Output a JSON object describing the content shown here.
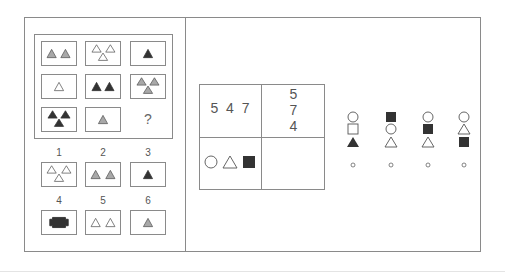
{
  "puzzle_left": {
    "matrix": [
      {
        "cell": "r1c1",
        "desc": "two gray triangles"
      },
      {
        "cell": "r1c2",
        "desc": "three white triangles"
      },
      {
        "cell": "r1c3",
        "desc": "one black triangle"
      },
      {
        "cell": "r2c1",
        "desc": "one white triangle"
      },
      {
        "cell": "r2c2",
        "desc": "two black triangles"
      },
      {
        "cell": "r2c3",
        "desc": "three gray triangles"
      },
      {
        "cell": "r3c1",
        "desc": "three black triangles"
      },
      {
        "cell": "r3c2",
        "desc": "one gray triangle"
      },
      {
        "cell": "r3c3",
        "desc": "?"
      }
    ],
    "question_mark": "?",
    "options": [
      {
        "label": "1",
        "desc": "three white triangles"
      },
      {
        "label": "2",
        "desc": "two gray triangles"
      },
      {
        "label": "3",
        "desc": "one black triangle"
      },
      {
        "label": "4",
        "desc": "black blob shape"
      },
      {
        "label": "5",
        "desc": "two white triangles"
      },
      {
        "label": "6",
        "desc": "one gray triangle"
      }
    ]
  },
  "puzzle_right": {
    "grid": {
      "top_left": "5 4 7",
      "top_right": [
        "5",
        "7",
        "4"
      ],
      "bottom_left": "circle, triangle, black square",
      "bottom_right": ""
    },
    "options": [
      {
        "index": 1,
        "stack": [
          "circle",
          "square",
          "black triangle"
        ]
      },
      {
        "index": 2,
        "stack": [
          "black square",
          "circle",
          "triangle"
        ]
      },
      {
        "index": 3,
        "stack": [
          "circle",
          "black square",
          "triangle"
        ]
      },
      {
        "index": 4,
        "stack": [
          "circle",
          "triangle",
          "black square"
        ]
      }
    ],
    "option_marker": "o"
  },
  "colors": {
    "line": "#8a8a8a",
    "black_fill": "#333333",
    "gray_fill": "#a8a8a8",
    "white_fill": "#ffffff",
    "stroke": "#555555"
  }
}
